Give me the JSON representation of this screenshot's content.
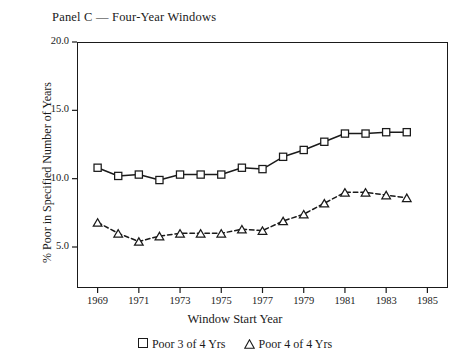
{
  "chart_data": {
    "type": "line",
    "title": "Panel C — Four-Year Windows",
    "xlabel": "Window Start Year",
    "ylabel": "% Poor in Specified Number of Years",
    "xlim": [
      1968,
      1986
    ],
    "ylim": [
      2.0,
      20.0
    ],
    "xticks": [
      1969,
      1971,
      1973,
      1975,
      1977,
      1979,
      1981,
      1983,
      1985
    ],
    "xtick_labels": [
      "1969",
      "1971",
      "1973",
      "1975",
      "1977",
      "1979",
      "1981",
      "1983",
      "1985"
    ],
    "yticks": [
      5.0,
      10.0,
      15.0,
      20.0
    ],
    "ytick_labels": [
      "5.0",
      "10.0",
      "15.0",
      "20.0"
    ],
    "grid": false,
    "legend_position": "below",
    "x": [
      1969,
      1970,
      1971,
      1972,
      1973,
      1974,
      1975,
      1976,
      1977,
      1978,
      1979,
      1980,
      1981,
      1982,
      1983,
      1984
    ],
    "series": [
      {
        "name": "Poor 3 of 4 Yrs",
        "marker": "square",
        "line_style": "solid",
        "color": "#1a1a1a",
        "values": [
          10.8,
          10.2,
          10.3,
          9.9,
          10.3,
          10.3,
          10.3,
          10.8,
          10.7,
          11.6,
          12.1,
          12.7,
          13.3,
          13.3,
          13.4,
          13.4
        ]
      },
      {
        "name": "Poor 4 of 4 Yrs",
        "marker": "triangle",
        "line_style": "dashed",
        "color": "#1a1a1a",
        "values": [
          6.8,
          6.0,
          5.4,
          5.8,
          6.0,
          6.0,
          6.0,
          6.3,
          6.2,
          6.9,
          7.4,
          8.2,
          9.0,
          9.0,
          8.8,
          8.6
        ]
      }
    ]
  },
  "legend": {
    "entries": [
      {
        "glyph": "square-marker-icon",
        "label": "Poor 3 of 4 Yrs"
      },
      {
        "glyph": "triangle-marker-icon",
        "label": "Poor 4 of 4 Yrs"
      }
    ]
  }
}
